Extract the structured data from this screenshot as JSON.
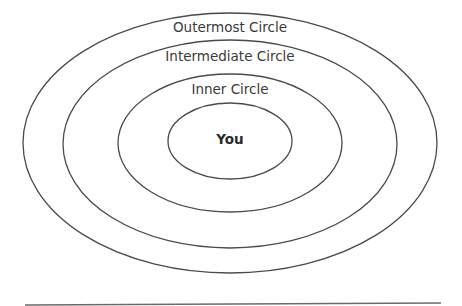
{
  "diagram": {
    "type": "concentric-ellipses",
    "circles": [
      {
        "id": "outermost",
        "label": "Outermost Circle",
        "cx": 230,
        "cy": 143,
        "rx": 207,
        "ry": 130,
        "label_y": 32
      },
      {
        "id": "intermediate",
        "label": "Intermediate Circle",
        "cx": 230,
        "cy": 144,
        "rx": 167,
        "ry": 104,
        "label_y": 61
      },
      {
        "id": "inner",
        "label": "Inner Circle",
        "cx": 230,
        "cy": 143,
        "rx": 112,
        "ry": 69,
        "label_y": 94
      },
      {
        "id": "you",
        "label": "You",
        "cx": 230,
        "cy": 141,
        "rx": 62,
        "ry": 38,
        "label_y": 144
      }
    ],
    "stroke_color": "#4a4a4a",
    "text_color": "#3a3a3a",
    "bottom_rule": {
      "x1": 25,
      "y1": 305,
      "x2": 441,
      "y2": 303
    }
  }
}
